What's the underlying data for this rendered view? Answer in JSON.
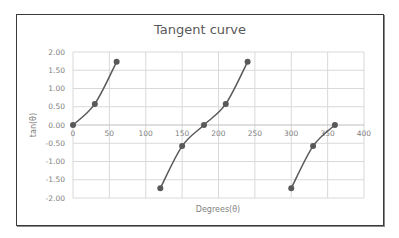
{
  "chart_data": {
    "type": "line",
    "title": "Tangent curve",
    "xlabel": "Degrees(θ)",
    "ylabel": "tan(θ)",
    "xlim": [
      0,
      400
    ],
    "ylim": [
      -2.0,
      2.0
    ],
    "x_ticks": [
      "0",
      "50",
      "100",
      "150",
      "200",
      "250",
      "300",
      "350",
      "400"
    ],
    "y_ticks": [
      "2.00",
      "1.50",
      "1.00",
      "0.50",
      "0.00",
      "-0.50",
      "-1.00",
      "-1.50",
      "-2.00"
    ],
    "grid": true,
    "legend": "none",
    "line_color": "#595959",
    "grid_color": "#d9d9d9",
    "series": [
      {
        "name": "branch-1",
        "x": [
          0,
          30,
          60
        ],
        "y": [
          0.0,
          0.577,
          1.732
        ]
      },
      {
        "name": "branch-2",
        "x": [
          120,
          150,
          180,
          210,
          240
        ],
        "y": [
          -1.732,
          -0.577,
          0.0,
          0.577,
          1.732
        ]
      },
      {
        "name": "branch-3",
        "x": [
          300,
          330,
          360
        ],
        "y": [
          -1.732,
          -0.577,
          0.0
        ]
      }
    ]
  }
}
